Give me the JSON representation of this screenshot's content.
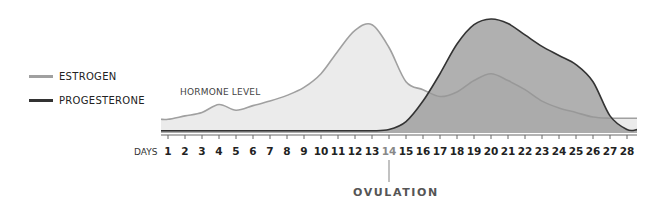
{
  "legend": [
    {
      "name": "ESTROGEN",
      "color": "#a0a0a0"
    },
    {
      "name": "PROGESTERONE",
      "color": "#333333"
    }
  ],
  "annotations": {
    "hormone_level": "HORMONE LEVEL",
    "ovulation": "OVULATION",
    "days": "DAYS"
  },
  "chart_data": {
    "type": "area",
    "title": "",
    "xlabel": "DAYS",
    "ylabel": "HORMONE LEVEL",
    "x": [
      1,
      2,
      3,
      4,
      5,
      6,
      7,
      8,
      9,
      10,
      11,
      12,
      13,
      14,
      15,
      16,
      17,
      18,
      19,
      20,
      21,
      22,
      23,
      24,
      25,
      26,
      27,
      28
    ],
    "series": [
      {
        "name": "ESTROGEN",
        "values": [
          12,
          15,
          18,
          25,
          20,
          24,
          28,
          33,
          40,
          52,
          72,
          90,
          95,
          75,
          45,
          38,
          32,
          36,
          46,
          52,
          46,
          38,
          28,
          22,
          18,
          14,
          13,
          13
        ]
      },
      {
        "name": "PROGESTERONE",
        "values": [
          2,
          2,
          2,
          2,
          2,
          2,
          2,
          2,
          2,
          2,
          2,
          2,
          2,
          3,
          10,
          28,
          52,
          78,
          95,
          100,
          96,
          86,
          76,
          68,
          60,
          45,
          15,
          3
        ]
      }
    ],
    "annotations": [
      {
        "x": 14,
        "label": "OVULATION"
      }
    ],
    "ylim": [
      0,
      100
    ],
    "grid": false,
    "legend_position": "left"
  }
}
